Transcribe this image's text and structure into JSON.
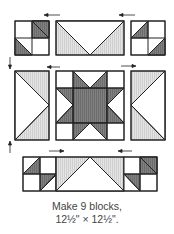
{
  "colors": {
    "dark": "#7a7a7a",
    "light": "#dedede",
    "line": "#222222",
    "bg": "#ffffff"
  },
  "caption": {
    "line1": "Make 9 blocks,",
    "line2": "12½\" × 12½\"."
  },
  "layout": {
    "rows": [
      {
        "name": "top-row",
        "units": [
          "four-patch",
          "flying-geese-down",
          "four-patch"
        ],
        "pressing": [
          "left",
          "left"
        ]
      },
      {
        "name": "middle-row",
        "units": [
          "flying-geese-right",
          "sawtooth-star",
          "flying-geese-left"
        ],
        "pressing": [
          "left",
          "right"
        ]
      },
      {
        "name": "bottom-row",
        "units": [
          "four-patch",
          "flying-geese-up",
          "four-patch"
        ],
        "pressing": [
          "right",
          "left"
        ],
        "joined": true
      }
    ],
    "row_pressing": [
      "down",
      "up"
    ]
  }
}
